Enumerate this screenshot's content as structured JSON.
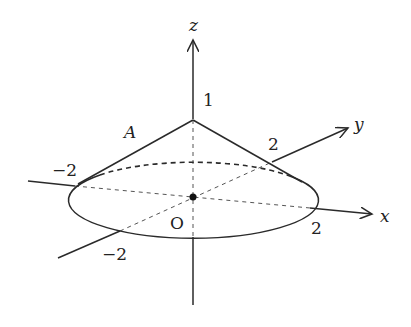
{
  "figure": {
    "type": "3d-cone-diagram",
    "axes": {
      "x": {
        "label": "x",
        "tick": "2",
        "neg_tick": "-2"
      },
      "y": {
        "label": "y",
        "tick": "2",
        "neg_tick": "-2"
      },
      "z": {
        "label": "z",
        "tick": "1"
      }
    },
    "labels": {
      "z_axis": "z",
      "y_axis": "y",
      "x_axis": "x",
      "apex_height": "1",
      "point_A": "A",
      "x_neg": "−2",
      "y_pos": "2",
      "x_pos": "2",
      "y_neg": "−2",
      "origin": "O"
    },
    "cone": {
      "apex_z": 1,
      "base_radius": 2
    },
    "colors": {
      "stroke": "#2a2a2a",
      "background": "#ffffff"
    }
  }
}
